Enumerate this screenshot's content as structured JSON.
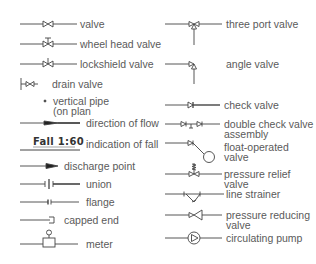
{
  "legend": {
    "left": [
      {
        "id": "valve",
        "label": "valve"
      },
      {
        "id": "wheel-head-valve",
        "label": "wheel head valve"
      },
      {
        "id": "lockshield-valve",
        "label": "lockshield valve"
      },
      {
        "id": "drain-valve",
        "label": "drain valve"
      },
      {
        "id": "vertical-pipe",
        "label": "vertical pipe",
        "label2": "(on plan"
      },
      {
        "id": "direction-of-flow",
        "label": "direction of flow"
      },
      {
        "id": "indication-of-fall",
        "label": "indication of fall",
        "symbol_text": "Fall  1:60"
      },
      {
        "id": "discharge-point",
        "label": "discharge point"
      },
      {
        "id": "union",
        "label": "union"
      },
      {
        "id": "flange",
        "label": "flange"
      },
      {
        "id": "capped-end",
        "label": "capped end"
      },
      {
        "id": "meter",
        "label": "meter"
      }
    ],
    "right": [
      {
        "id": "three-port-valve",
        "label": "three port valve"
      },
      {
        "id": "angle-valve",
        "label": "angle valve"
      },
      {
        "id": "check-valve",
        "label": "check valve"
      },
      {
        "id": "double-check-valve-assembly",
        "label": "double check valve",
        "label2": "assembly"
      },
      {
        "id": "float-operated-valve",
        "label": "float-operated",
        "label2": "valve"
      },
      {
        "id": "pressure-relief-valve",
        "label": "pressure relief",
        "label2": "valve"
      },
      {
        "id": "line-strainer",
        "label": "line strainer"
      },
      {
        "id": "pressure-reducing-valve",
        "label": "pressure reducing",
        "label2": "valve"
      },
      {
        "id": "circulating-pump",
        "label": "circulating pump"
      }
    ]
  },
  "colors": {
    "line": "#444444",
    "text": "#5a5a5a"
  }
}
